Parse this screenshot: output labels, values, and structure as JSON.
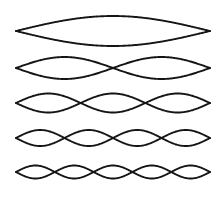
{
  "figure": {
    "name": "standing-wave-harmonics-diagram",
    "background_color": "#ffffff",
    "stroke_color": "#151515",
    "width": 222,
    "height": 201
  },
  "chart_data": {
    "type": "line",
    "subtitle": "",
    "xlabel": "",
    "ylabel": "",
    "grid": false,
    "legend": "none",
    "annotations": [],
    "x_start": 16,
    "x_end": 210,
    "xlim": [
      0,
      222
    ],
    "ylim": [
      201,
      0
    ],
    "series": [
      {
        "name": "harmonic-1",
        "harmonic": 1,
        "loops": 1,
        "nodes": 2,
        "antinodes": 1,
        "center_y": 31,
        "amplitude": 15,
        "stroke_width": 1.9,
        "label": "First harmonic (fundamental)"
      },
      {
        "name": "harmonic-2",
        "harmonic": 2,
        "loops": 2,
        "nodes": 3,
        "antinodes": 2,
        "center_y": 68,
        "amplitude": 11,
        "stroke_width": 1.9,
        "label": "Second harmonic"
      },
      {
        "name": "harmonic-3",
        "harmonic": 3,
        "loops": 3,
        "nodes": 4,
        "antinodes": 3,
        "center_y": 103,
        "amplitude": 9.5,
        "stroke_width": 1.9,
        "label": "Third harmonic"
      },
      {
        "name": "harmonic-4",
        "harmonic": 4,
        "loops": 4,
        "nodes": 5,
        "antinodes": 4,
        "center_y": 138,
        "amplitude": 8,
        "stroke_width": 1.9,
        "label": "Fourth harmonic"
      },
      {
        "name": "harmonic-5",
        "harmonic": 5,
        "loops": 5,
        "nodes": 6,
        "antinodes": 5,
        "center_y": 172,
        "amplitude": 6.5,
        "stroke_width": 1.9,
        "label": "Fifth harmonic"
      }
    ]
  }
}
